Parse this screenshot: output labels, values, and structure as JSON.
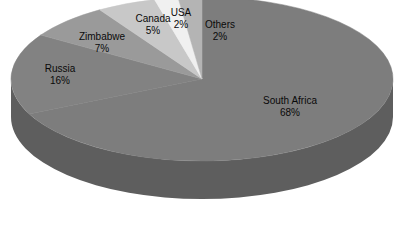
{
  "chart_data": {
    "type": "pie",
    "title": "",
    "subtitle": "",
    "xlabel": "",
    "ylabel": "",
    "legend": "none",
    "grid": false,
    "units": "percent",
    "start_angle_deg": 0,
    "direction": "clockwise",
    "three_d": true,
    "categories": [
      "South Africa",
      "Russia",
      "Zimbabwe",
      "Canada",
      "USA",
      "Others"
    ],
    "values": [
      68,
      16,
      7,
      5,
      2,
      2
    ],
    "labels": [
      "South Africa",
      "Russia",
      "Zimbabwe",
      "Canada",
      "USA",
      "Others"
    ],
    "value_labels": [
      "68%",
      "16%",
      "7%",
      "5%",
      "2%",
      "2%"
    ],
    "slices": [
      {
        "name": "South Africa",
        "value": 68,
        "value_label": "68%",
        "color": "#7d7d7d",
        "side_color": "#5e5e5e"
      },
      {
        "name": "Russia",
        "value": 16,
        "value_label": "16%",
        "color": "#828282",
        "side_color": "#5e5e5e"
      },
      {
        "name": "Zimbabwe",
        "value": 7,
        "value_label": "7%",
        "color": "#9a9a9a",
        "side_color": "#5e5e5e"
      },
      {
        "name": "Canada",
        "value": 5,
        "value_label": "5%",
        "color": "#c8c8c8",
        "side_color": "#5e5e5e"
      },
      {
        "name": "USA",
        "value": 2,
        "value_label": "2%",
        "color": "#f0f0f0",
        "side_color": "#5e5e5e"
      },
      {
        "name": "Others",
        "value": 2,
        "value_label": "2%",
        "color": "#b4b4b4",
        "side_color": "#5e5e5e"
      }
    ]
  },
  "colors": {
    "background": "#ffffff",
    "label_text": "#0a0a0a",
    "rim": "#5e5e5e",
    "south_africa": "#7d7d7d",
    "russia": "#828282",
    "zimbabwe": "#9a9a9a",
    "canada": "#c8c8c8",
    "usa": "#f0f0f0",
    "others": "#b4b4b4"
  }
}
